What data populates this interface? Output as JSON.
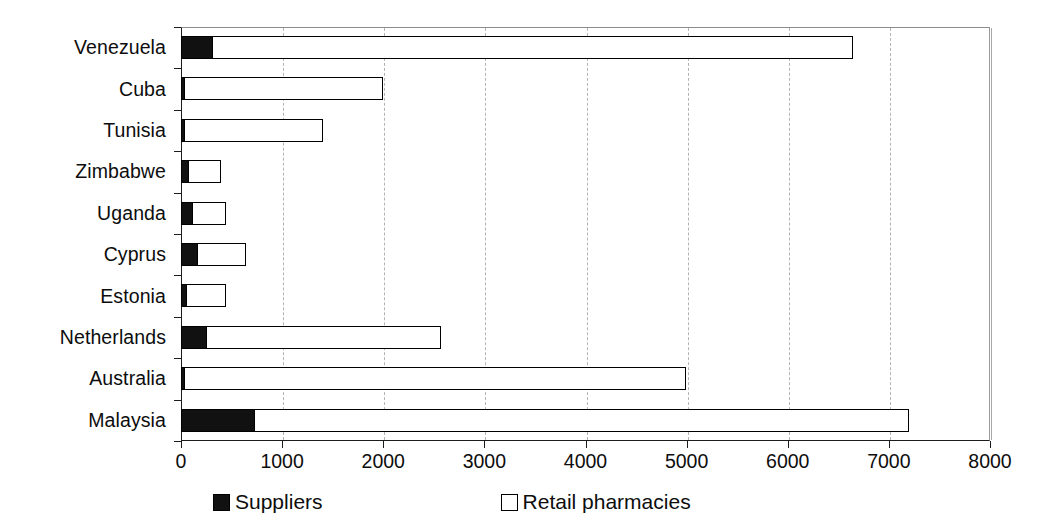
{
  "chart_data": {
    "type": "bar",
    "orientation": "horizontal",
    "stacked": true,
    "title": "",
    "subtitle": "",
    "xlabel": "",
    "ylabel": "",
    "xlim": [
      0,
      8000
    ],
    "xticks": [
      0,
      1000,
      2000,
      3000,
      4000,
      5000,
      6000,
      7000,
      8000
    ],
    "xtick_labels": [
      "0",
      "1000",
      "2000",
      "3000",
      "4000",
      "5000",
      "6000",
      "7000",
      "8000"
    ],
    "grid": "vertical-dashed",
    "legend_position": "bottom",
    "categories": [
      "Venezuela",
      "Cuba",
      "Tunisia",
      "Zimbabwe",
      "Uganda",
      "Cyprus",
      "Estonia",
      "Netherlands",
      "Australia",
      "Malaysia"
    ],
    "series": [
      {
        "name": "Suppliers",
        "color": "#111111",
        "style": "filled",
        "values": [
          310,
          20,
          30,
          70,
          110,
          160,
          45,
          250,
          15,
          720
        ]
      },
      {
        "name": "Retail pharmacies",
        "color": "#ffffff",
        "style": "hollow",
        "values": [
          6340,
          1970,
          1370,
          330,
          335,
          485,
          400,
          2320,
          4965,
          6480
        ]
      }
    ],
    "totals": [
      6650,
      1990,
      1400,
      400,
      445,
      645,
      445,
      2570,
      4980,
      7200
    ]
  },
  "legend": {
    "items": [
      {
        "label": "Suppliers",
        "swatch": "filled-square"
      },
      {
        "label": "Retail pharmacies",
        "swatch": "hollow-square"
      }
    ]
  },
  "axis": {
    "x": {
      "ticks": [
        "0",
        "1000",
        "2000",
        "3000",
        "4000",
        "5000",
        "6000",
        "7000",
        "8000"
      ]
    },
    "y": {
      "ticks": [
        "Venezuela",
        "Cuba",
        "Tunisia",
        "Zimbabwe",
        "Uganda",
        "Cyprus",
        "Estonia",
        "Netherlands",
        "Australia",
        "Malaysia"
      ]
    }
  }
}
